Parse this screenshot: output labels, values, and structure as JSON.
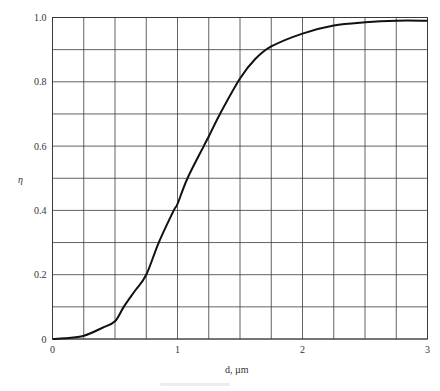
{
  "chart_data": {
    "type": "line",
    "title": "",
    "xlabel": "d, µm",
    "ylabel": "η",
    "xlim": [
      0,
      3
    ],
    "ylim": [
      0,
      1.0
    ],
    "grid": true,
    "x_grid_step": 0.25,
    "y_grid_step": 0.1,
    "x_ticks": [
      {
        "value": 0,
        "label": "0"
      },
      {
        "value": 1,
        "label": "1"
      },
      {
        "value": 2,
        "label": "2"
      },
      {
        "value": 3,
        "label": "3"
      }
    ],
    "y_ticks": [
      {
        "value": 0,
        "label": "0"
      },
      {
        "value": 0.2,
        "label": "0.2"
      },
      {
        "value": 0.4,
        "label": "0.4"
      },
      {
        "value": 0.6,
        "label": "0.6"
      },
      {
        "value": 0.8,
        "label": "0.8"
      },
      {
        "value": 1.0,
        "label": "1.0"
      }
    ],
    "legend": null,
    "series": [
      {
        "name": "η vs d",
        "x": [
          0,
          0.1,
          0.25,
          0.4,
          0.5,
          0.57,
          0.66,
          0.75,
          0.85,
          0.97,
          1.0,
          1.08,
          1.21,
          1.25,
          1.34,
          1.5,
          1.62,
          1.75,
          2.0,
          2.25,
          2.5,
          2.75,
          3.0
        ],
        "values": [
          0,
          0.002,
          0.01,
          0.035,
          0.055,
          0.1,
          0.15,
          0.2,
          0.3,
          0.4,
          0.42,
          0.5,
          0.6,
          0.63,
          0.7,
          0.81,
          0.87,
          0.91,
          0.95,
          0.975,
          0.985,
          0.99,
          0.99
        ]
      }
    ]
  },
  "plot_area": {
    "left": 52.5,
    "right": 427.5,
    "top": 17.5,
    "bottom": 339
  },
  "colors": {
    "grid": "#3a3a3a",
    "curve": "#111111",
    "text": "#333333"
  }
}
